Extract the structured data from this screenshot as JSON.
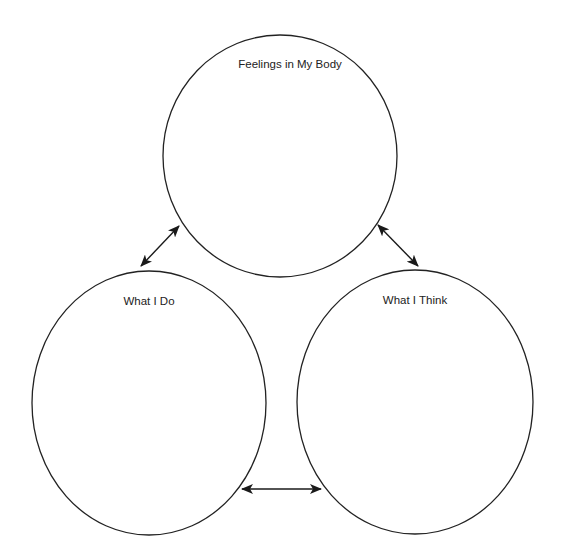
{
  "diagram": {
    "type": "cycle",
    "nodes": [
      {
        "id": "feelings",
        "label": "Feelings in My Body"
      },
      {
        "id": "do",
        "label": "What I Do"
      },
      {
        "id": "think",
        "label": "What I Think"
      }
    ],
    "edges": [
      {
        "from": "feelings",
        "to": "do",
        "bidirectional": true
      },
      {
        "from": "feelings",
        "to": "think",
        "bidirectional": true
      },
      {
        "from": "do",
        "to": "think",
        "bidirectional": true
      }
    ],
    "colors": {
      "stroke": "#222222",
      "background": "#ffffff"
    }
  }
}
